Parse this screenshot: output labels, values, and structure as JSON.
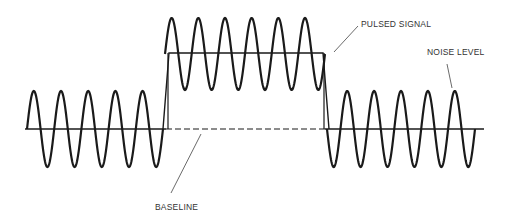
{
  "diagram": {
    "type": "signal-waveform",
    "labels": {
      "pulsed_signal": "PULSED SIGNAL",
      "noise_level": "NOISE LEVEL",
      "baseline": "BASELINE"
    },
    "colors": {
      "stroke": "#1a1a1a",
      "leader": "#444444",
      "background": "#ffffff"
    },
    "geometry": {
      "baseline_y": 129,
      "noise_amplitude": 38,
      "pulse_top_y": 54,
      "pulse_amplitude": 36,
      "left_segment": {
        "x_start": 27,
        "x_end": 163,
        "cycles": 5
      },
      "pulse_segment": {
        "x_start": 163,
        "x_end": 327,
        "cycles": 6
      },
      "right_segment": {
        "x_start": 327,
        "x_end": 475,
        "cycles": 5.5
      }
    }
  }
}
